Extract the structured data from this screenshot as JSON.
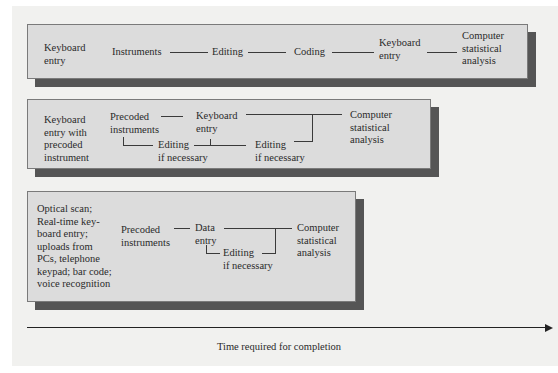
{
  "diagram": {
    "rows": [
      {
        "method": "Keyboard entry",
        "method_lines": [
          "Keyboard",
          "entry"
        ],
        "steps": [
          {
            "label": "Instruments"
          },
          {
            "label": "Editing"
          },
          {
            "label": "Coding"
          },
          {
            "label_lines": [
              "Keyboard",
              "entry"
            ]
          },
          {
            "label_lines": [
              "Computer",
              "statistical",
              "analysis"
            ]
          }
        ]
      },
      {
        "method": "Keyboard entry with precoded instrument",
        "method_lines": [
          "Keyboard",
          "entry with",
          "precoded",
          "instrument"
        ],
        "steps": [
          {
            "label_lines": [
              "Precoded",
              "instruments"
            ]
          },
          {
            "label_lines": [
              "Keyboard",
              "entry"
            ]
          },
          {
            "label_lines": [
              "Editing",
              "if necessary"
            ]
          },
          {
            "label_lines": [
              "Editing",
              "if necessary"
            ]
          },
          {
            "label_lines": [
              "Computer",
              "statistical",
              "analysis"
            ]
          }
        ]
      },
      {
        "method": "Optical scan; Real-time keyboard entry; uploads from PCs, telephone keypad; bar code; voice recognition",
        "method_lines": [
          "Optical scan;",
          "Real-time key-",
          "board entry;",
          "uploads from",
          "PCs, telephone",
          "keypad; bar code;",
          "voice recognition"
        ],
        "steps": [
          {
            "label_lines": [
              "Precoded",
              "instruments"
            ]
          },
          {
            "label_lines": [
              "Data",
              "entry"
            ]
          },
          {
            "label_lines": [
              "Editing",
              "if necessary"
            ]
          },
          {
            "label_lines": [
              "Computer",
              "statistical",
              "analysis"
            ]
          }
        ]
      }
    ],
    "axis": {
      "label": "Time required for completion",
      "direction": "right"
    }
  }
}
